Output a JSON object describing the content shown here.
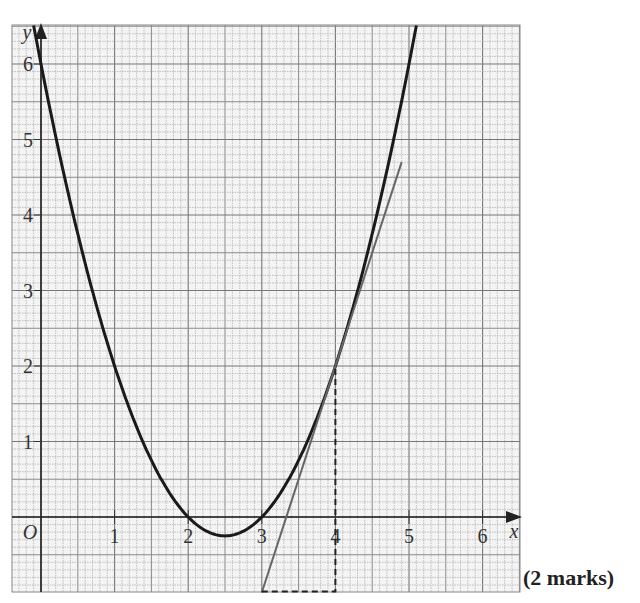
{
  "chart_data": {
    "type": "line",
    "title": "",
    "xlabel": "x",
    "ylabel": "y",
    "origin_label": "O",
    "xlim": [
      -0.4,
      6.5
    ],
    "ylim": [
      -1,
      6.5
    ],
    "x_ticks": [
      1,
      2,
      3,
      4,
      5,
      6
    ],
    "y_ticks": [
      1,
      2,
      3,
      4,
      5,
      6
    ],
    "grid": {
      "on": true,
      "minor_step": 0.1,
      "medium_step": 0.5,
      "major_step": 1
    },
    "series": [
      {
        "name": "curve",
        "equation": "y = x^2 - 5x + 6",
        "style": "solid-thick",
        "x": [
          -0.1,
          0,
          0.5,
          1,
          1.5,
          2,
          2.5,
          3,
          3.5,
          4,
          4.5,
          5,
          5.1
        ],
        "y": [
          6.51,
          6,
          3.75,
          2,
          0.75,
          0,
          -0.25,
          0,
          0.75,
          2,
          3.75,
          6,
          6.51
        ]
      },
      {
        "name": "tangent at x=4",
        "equation": "y = 3x - 10",
        "style": "solid-thin-grey",
        "x": [
          3,
          4.9
        ],
        "y": [
          -1,
          4.7
        ]
      },
      {
        "name": "dashed construction",
        "style": "dashed",
        "x": [
          3,
          4,
          4
        ],
        "y": [
          -1,
          -1,
          2
        ]
      }
    ]
  },
  "footer": {
    "marks": "(2 marks)"
  }
}
